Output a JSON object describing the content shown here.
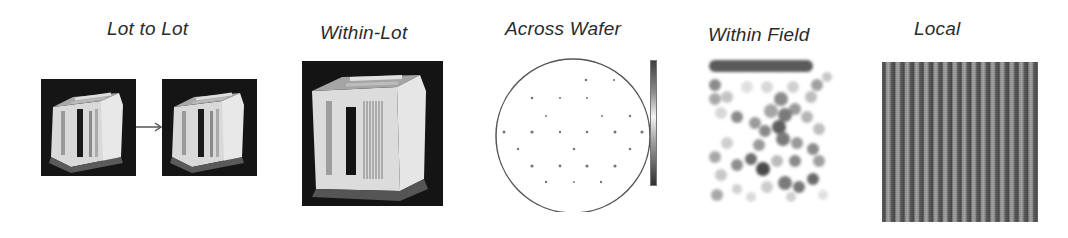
{
  "panels": [
    {
      "id": "lot-to-lot",
      "title": "Lot to Lot",
      "content": "two wafer-carrier photos connected by an arrow"
    },
    {
      "id": "within-lot",
      "title": "Within-Lot",
      "content": "wafer-carrier photo"
    },
    {
      "id": "across-wafer",
      "title": "Across Wafer",
      "content": "circular wafer map with measurement points and grayscale colorbar"
    },
    {
      "id": "within-field",
      "title": "Within Field",
      "content": "grayscale dot map of field variation"
    },
    {
      "id": "local",
      "title": "Local",
      "content": "vertical line/space pattern image"
    }
  ],
  "colors": {
    "background": "#ffffff",
    "title_text": "#2b2b2b",
    "photo_background": "#1a1a1a",
    "wafer_outline": "#555555",
    "arrow": "#555555"
  },
  "icons": {
    "arrow": "right-arrow-icon"
  }
}
